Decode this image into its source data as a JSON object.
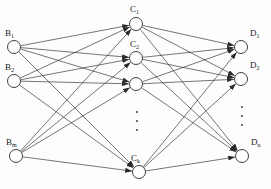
{
  "figure": {
    "type": "neural-network-diagram",
    "title": "",
    "background_color": "#fdfdfd",
    "line_color": "#2b2b2b",
    "node_fill": "#ffffff",
    "node_stroke": "#2b2b2b"
  },
  "layers": [
    {
      "name": "input-layer",
      "prefix": "B",
      "count_label": "m",
      "nodes": [
        {
          "label": "B",
          "sub": "1",
          "cx": 14,
          "cy": 47,
          "r": 6.5,
          "label_x": 5,
          "label_y": 29
        },
        {
          "label": "B",
          "sub": "2",
          "cx": 14,
          "cy": 81,
          "r": 6.5,
          "label_x": 5,
          "label_y": 63
        },
        {
          "label": "B",
          "sub": "m",
          "cx": 16,
          "cy": 156,
          "r": 6.5,
          "label_x": 6,
          "label_y": 138
        }
      ]
    },
    {
      "name": "hidden-layer",
      "prefix": "C",
      "count_label": "k",
      "nodes": [
        {
          "label": "C",
          "sub": "1",
          "cx": 136,
          "cy": 24,
          "r": 6.5,
          "label_x": 130,
          "label_y": 5
        },
        {
          "label": "C",
          "sub": "2",
          "cx": 136,
          "cy": 58,
          "r": 6.5,
          "label_x": 130,
          "label_y": 40
        },
        {
          "label": "",
          "sub": "",
          "cx": 136,
          "cy": 84,
          "r": 6.5,
          "label_x": 0,
          "label_y": 0
        },
        {
          "label": "C",
          "sub": "k",
          "cx": 139,
          "cy": 172,
          "r": 6.5,
          "label_x": 131,
          "label_y": 154
        }
      ]
    },
    {
      "name": "output-layer",
      "prefix": "D",
      "count_label": "n",
      "nodes": [
        {
          "label": "D",
          "sub": "1",
          "cx": 241,
          "cy": 47,
          "r": 6.5,
          "label_x": 250,
          "label_y": 29
        },
        {
          "label": "D",
          "sub": "2",
          "cx": 241,
          "cy": 79,
          "r": 6.5,
          "label_x": 250,
          "label_y": 61
        },
        {
          "label": "D",
          "sub": "n",
          "cx": 242,
          "cy": 156,
          "r": 6.5,
          "label_x": 251,
          "label_y": 138
        }
      ]
    }
  ],
  "ellipses": [
    {
      "name": "hidden-layer-ellipsis",
      "x": 137,
      "y_start": 112,
      "dots": 3,
      "spacing": 9
    },
    {
      "name": "output-layer-ellipsis",
      "x": 242,
      "y_start": 107,
      "dots": 3,
      "spacing": 9
    }
  ],
  "connections": {
    "input_to_hidden": "fully-connected",
    "hidden_to_output": "fully-connected",
    "arrowheads": "filled-triangle-at-target"
  }
}
